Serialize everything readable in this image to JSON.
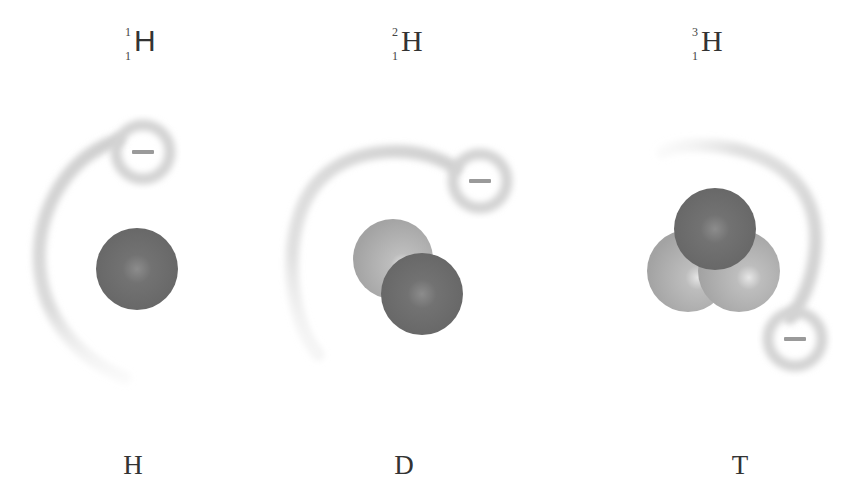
{
  "isotopes": [
    {
      "symbol": "H",
      "mass_number": "1",
      "atomic_number": "1",
      "name": "H",
      "protons": 1,
      "neutrons": 0,
      "electron_charge": "−"
    },
    {
      "symbol": "H",
      "mass_number": "2",
      "atomic_number": "1",
      "name": "D",
      "protons": 1,
      "neutrons": 1,
      "electron_charge": "−"
    },
    {
      "symbol": "H",
      "mass_number": "3",
      "atomic_number": "1",
      "name": "T",
      "protons": 1,
      "neutrons": 2,
      "electron_charge": "−"
    }
  ],
  "colors": {
    "proton": "#6e6e6e",
    "neutron": "#a9a9a9",
    "electron_cloud": "#d4d4d4",
    "electron_sign": "#9a9a9a",
    "text": "#333333"
  }
}
